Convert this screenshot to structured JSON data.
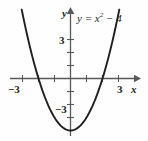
{
  "figure": {
    "name": "parabola-graph",
    "background_color": "#fefefe",
    "curve_color": "#231f20",
    "axis_color": "#58595b"
  },
  "labels": {
    "axis_x_name": "x",
    "axis_y_name": "y",
    "equation_lhs": "y",
    "equation_eq": "=",
    "equation_var": "x",
    "equation_exp": "2",
    "equation_rest": "− 4",
    "equation_full": "y = x² − 4"
  },
  "ticks": {
    "x_neg3": "−3",
    "x_pos3": "3",
    "y_pos3": "3",
    "y_neg3": "−3"
  },
  "chart_data": {
    "type": "line",
    "title": "",
    "subtitle": "",
    "xlabel": "x",
    "ylabel": "y",
    "annotations": [
      "y = x² − 4"
    ],
    "grid": false,
    "legend": false,
    "legend_position": "none",
    "xlim": [
      -3.6,
      3.6
    ],
    "ylim": [
      -5.0,
      4.6
    ],
    "xticks": [
      -3,
      -2,
      -1,
      1,
      2,
      3
    ],
    "yticks": [
      -3,
      -2,
      -1,
      1,
      2,
      3
    ],
    "xtick_labels_shown": {
      "-3": "−3",
      "3": "3"
    },
    "ytick_labels_shown": {
      "3": "3",
      "-3": "−3"
    },
    "series": [
      {
        "name": "y = x^2 - 4",
        "equation": "y = x^2 - 4",
        "vertex": [
          0,
          -4
        ],
        "roots": [
          -2,
          2
        ],
        "x": [
          -2.95,
          -2.75,
          -2.5,
          -2.25,
          -2.0,
          -1.75,
          -1.5,
          -1.25,
          -1.0,
          -0.75,
          -0.5,
          -0.25,
          0,
          0.25,
          0.5,
          0.75,
          1.0,
          1.25,
          1.5,
          1.75,
          2.0,
          2.25,
          2.5,
          2.75,
          2.95
        ],
        "values": [
          4.7,
          3.56,
          2.25,
          1.06,
          0,
          -0.94,
          -1.75,
          -2.44,
          -3,
          -3.44,
          -3.75,
          -3.94,
          -4,
          -3.94,
          -3.75,
          -3.44,
          -3,
          -2.44,
          -1.75,
          -0.94,
          0,
          1.06,
          2.25,
          3.56,
          4.7
        ]
      }
    ]
  }
}
